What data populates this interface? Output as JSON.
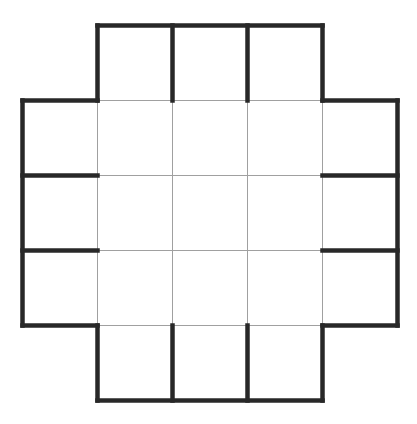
{
  "figure": {
    "canvas": {
      "width": 417,
      "height": 424,
      "background": "#ffffff"
    },
    "grid": {
      "cols_x": [
        22.5,
        97.5,
        172.5,
        247.5,
        322.5,
        397.5
      ],
      "rows_y": [
        25.5,
        100.5,
        175.5,
        250.5,
        325.5,
        400.5
      ],
      "cell_size": 75,
      "cells_total": 21,
      "removed_corners": [
        "top-left",
        "top-right",
        "bottom-left",
        "bottom-right"
      ]
    },
    "styles": {
      "thick": {
        "color": "#282828",
        "width": 4.5,
        "cap": "square"
      },
      "thin": {
        "color": "#a0a0a0",
        "width": 1,
        "cap": "butt"
      }
    },
    "segments": [
      {
        "x1": 1,
        "y1": 1,
        "x2": 4,
        "y2": 1,
        "style": "thin",
        "name": "inner-h-row1"
      },
      {
        "x1": 1,
        "y1": 2,
        "x2": 4,
        "y2": 2,
        "style": "thin",
        "name": "inner-h-row2"
      },
      {
        "x1": 1,
        "y1": 3,
        "x2": 4,
        "y2": 3,
        "style": "thin",
        "name": "inner-h-row3"
      },
      {
        "x1": 1,
        "y1": 4,
        "x2": 4,
        "y2": 4,
        "style": "thin",
        "name": "inner-h-row4"
      },
      {
        "x1": 1,
        "y1": 1,
        "x2": 1,
        "y2": 4,
        "style": "thin",
        "name": "inner-v-col1"
      },
      {
        "x1": 2,
        "y1": 1,
        "x2": 2,
        "y2": 4,
        "style": "thin",
        "name": "inner-v-col2"
      },
      {
        "x1": 3,
        "y1": 1,
        "x2": 3,
        "y2": 4,
        "style": "thin",
        "name": "inner-v-col3"
      },
      {
        "x1": 4,
        "y1": 1,
        "x2": 4,
        "y2": 4,
        "style": "thin",
        "name": "inner-v-col4"
      },
      {
        "x1": 1,
        "y1": 0,
        "x2": 4,
        "y2": 0,
        "style": "thick",
        "name": "outer-top"
      },
      {
        "x1": 1,
        "y1": 5,
        "x2": 4,
        "y2": 5,
        "style": "thick",
        "name": "outer-bottom"
      },
      {
        "x1": 0,
        "y1": 1,
        "x2": 0,
        "y2": 4,
        "style": "thick",
        "name": "outer-left"
      },
      {
        "x1": 5,
        "y1": 1,
        "x2": 5,
        "y2": 4,
        "style": "thick",
        "name": "outer-right"
      },
      {
        "x1": 1,
        "y1": 0,
        "x2": 1,
        "y2": 1,
        "style": "thick",
        "name": "step-top-left-v"
      },
      {
        "x1": 4,
        "y1": 0,
        "x2": 4,
        "y2": 1,
        "style": "thick",
        "name": "step-top-right-v"
      },
      {
        "x1": 0,
        "y1": 1,
        "x2": 1,
        "y2": 1,
        "style": "thick",
        "name": "step-top-left-h"
      },
      {
        "x1": 4,
        "y1": 1,
        "x2": 5,
        "y2": 1,
        "style": "thick",
        "name": "step-top-right-h"
      },
      {
        "x1": 1,
        "y1": 4,
        "x2": 1,
        "y2": 5,
        "style": "thick",
        "name": "step-bottom-left-v"
      },
      {
        "x1": 4,
        "y1": 4,
        "x2": 4,
        "y2": 5,
        "style": "thick",
        "name": "step-bottom-right-v"
      },
      {
        "x1": 0,
        "y1": 4,
        "x2": 1,
        "y2": 4,
        "style": "thick",
        "name": "step-bottom-left-h"
      },
      {
        "x1": 4,
        "y1": 4,
        "x2": 5,
        "y2": 4,
        "style": "thick",
        "name": "step-bottom-right-h"
      },
      {
        "x1": 2,
        "y1": 0,
        "x2": 2,
        "y2": 1,
        "style": "thick",
        "name": "top-arm-divider-1"
      },
      {
        "x1": 3,
        "y1": 0,
        "x2": 3,
        "y2": 1,
        "style": "thick",
        "name": "top-arm-divider-2"
      },
      {
        "x1": 2,
        "y1": 4,
        "x2": 2,
        "y2": 5,
        "style": "thick",
        "name": "bottom-arm-divider-1"
      },
      {
        "x1": 3,
        "y1": 4,
        "x2": 3,
        "y2": 5,
        "style": "thick",
        "name": "bottom-arm-divider-2"
      },
      {
        "x1": 0,
        "y1": 2,
        "x2": 1,
        "y2": 2,
        "style": "thick",
        "name": "left-arm-divider-1"
      },
      {
        "x1": 0,
        "y1": 3,
        "x2": 1,
        "y2": 3,
        "style": "thick",
        "name": "left-arm-divider-2"
      },
      {
        "x1": 4,
        "y1": 2,
        "x2": 5,
        "y2": 2,
        "style": "thick",
        "name": "right-arm-divider-1"
      },
      {
        "x1": 4,
        "y1": 3,
        "x2": 5,
        "y2": 3,
        "style": "thick",
        "name": "right-arm-divider-2"
      }
    ]
  }
}
